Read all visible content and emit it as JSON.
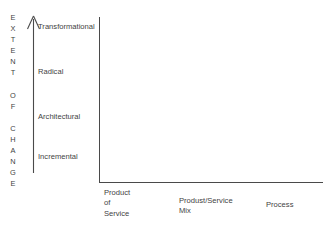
{
  "diagram": {
    "title_vertical": "EXTENT OF CHANGE",
    "vertical_letters": [
      "E",
      "X",
      "T",
      "E",
      "N",
      "T",
      " ",
      "O",
      "F",
      " ",
      "C",
      "H",
      "A",
      "N",
      "G",
      "E"
    ],
    "arrow_direction": "up",
    "axis_color": "#4a4a4a",
    "text_color": "#3f3f3f",
    "background_color": "#ffffff",
    "y_axis": {
      "name": "Extent of Change",
      "levels": [
        {
          "label": "Transformational",
          "top": 22
        },
        {
          "label": "Radical",
          "top": 67
        },
        {
          "label": "Architectural",
          "top": 112
        },
        {
          "label": "Incremental",
          "top": 152
        }
      ]
    },
    "x_axis": {
      "name": "Focus of Innovation",
      "categories": [
        {
          "label": "Product\nof\nService",
          "left": 104
        },
        {
          "label": "Produst/Service\nMix",
          "left": 179
        },
        {
          "label": "Process",
          "left": 266
        }
      ]
    }
  }
}
